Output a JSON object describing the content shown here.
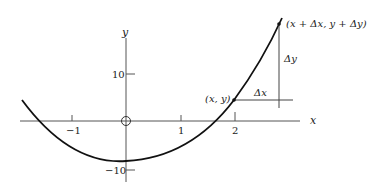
{
  "diagram": {
    "axes": {
      "x_label": "x",
      "y_label": "y",
      "x_ticks": [
        {
          "value": -1,
          "label": "−1"
        },
        {
          "value": 1,
          "label": "1"
        },
        {
          "value": 2,
          "label": "2"
        }
      ],
      "y_ticks": [
        {
          "value": 10,
          "label": "10"
        },
        {
          "value": -10,
          "label": "−10"
        }
      ],
      "origin_marker": "circle"
    },
    "points": {
      "p1_label": "(x, y)",
      "p2_label": "(x + Δx, y + Δy)"
    },
    "increments": {
      "dx_label": "Δx",
      "dy_label": "Δy"
    },
    "colors": {
      "ink": "#222222",
      "background": "#ffffff"
    }
  }
}
